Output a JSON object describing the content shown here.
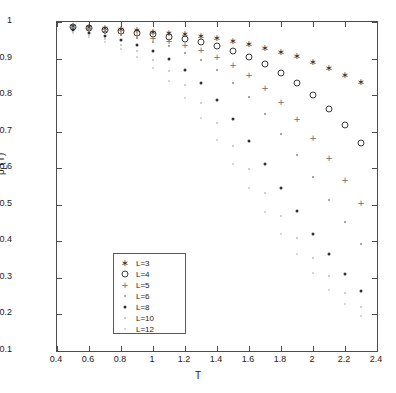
{
  "chart_data": {
    "type": "scatter",
    "title": "",
    "xlabel": "T",
    "ylabel": "ρ_L(T)",
    "xlim": [
      0.4,
      2.4
    ],
    "ylim": [
      0.1,
      1.0
    ],
    "xticks": [
      "0.4",
      "0.6",
      "0.8",
      "1",
      "1.2",
      "1.4",
      "1.6",
      "1.8",
      "2",
      "2.2",
      "2.4"
    ],
    "xtick_values": [
      0.4,
      0.6,
      0.8,
      1.0,
      1.2,
      1.4,
      1.6,
      1.8,
      2.0,
      2.2,
      2.4
    ],
    "yticks": [
      "0.1",
      "0.2",
      "0.3",
      "0.4",
      "0.5",
      "0.6",
      "0.7",
      "0.8",
      "0.9",
      "1"
    ],
    "ytick_values": [
      0.1,
      0.2,
      0.3,
      0.4,
      0.5,
      0.6,
      0.7,
      0.8,
      0.9,
      1.0
    ],
    "grid": false,
    "legend_position": "lower-left",
    "series": [
      {
        "name": "L=3",
        "marker": "asterisk",
        "color": "#2b2b2b",
        "x": [
          0.5,
          0.6,
          0.7,
          0.8,
          0.9,
          1.0,
          1.1,
          1.2,
          1.3,
          1.4,
          1.5,
          1.6,
          1.7,
          1.8,
          1.9,
          2.0,
          2.1,
          2.2,
          2.3
        ],
        "y": [
          0.988,
          0.986,
          0.983,
          0.98,
          0.977,
          0.974,
          0.97,
          0.966,
          0.961,
          0.955,
          0.948,
          0.94,
          0.93,
          0.919,
          0.906,
          0.891,
          0.874,
          0.856,
          0.835
        ]
      },
      {
        "name": "L=4",
        "marker": "circle",
        "color": "#3a3a3a",
        "x": [
          0.5,
          0.6,
          0.7,
          0.8,
          0.9,
          1.0,
          1.1,
          1.2,
          1.3,
          1.4,
          1.5,
          1.6,
          1.7,
          1.8,
          1.9,
          2.0,
          2.1,
          2.2,
          2.3
        ],
        "y": [
          0.986,
          0.983,
          0.979,
          0.975,
          0.971,
          0.966,
          0.96,
          0.953,
          0.945,
          0.934,
          0.921,
          0.905,
          0.885,
          0.861,
          0.833,
          0.8,
          0.762,
          0.718,
          0.668
        ]
      },
      {
        "name": "L=5",
        "marker": "plus",
        "color": "#6d6d6d",
        "x": [
          0.5,
          0.6,
          0.7,
          0.8,
          0.9,
          1.0,
          1.1,
          1.2,
          1.3,
          1.4,
          1.5,
          1.6,
          1.7,
          1.8,
          1.9,
          2.0,
          2.1,
          2.2,
          2.3
        ],
        "y": [
          0.984,
          0.98,
          0.975,
          0.97,
          0.964,
          0.957,
          0.948,
          0.937,
          0.923,
          0.905,
          0.882,
          0.854,
          0.82,
          0.78,
          0.735,
          0.684,
          0.628,
          0.568,
          0.505
        ]
      },
      {
        "name": "L=6",
        "marker": "dot",
        "color": "#8a8a8a",
        "x": [
          0.5,
          0.6,
          0.7,
          0.8,
          0.9,
          1.0,
          1.1,
          1.2,
          1.3,
          1.4,
          1.5,
          1.6,
          1.7,
          1.8,
          1.9,
          2.0,
          2.1,
          2.2,
          2.3
        ],
        "y": [
          0.982,
          0.977,
          0.971,
          0.964,
          0.956,
          0.946,
          0.933,
          0.916,
          0.895,
          0.868,
          0.834,
          0.794,
          0.747,
          0.694,
          0.637,
          0.576,
          0.514,
          0.452,
          0.392
        ]
      },
      {
        "name": "L=8",
        "marker": "dot-dark",
        "color": "#2f2f2f",
        "x": [
          0.5,
          0.6,
          0.7,
          0.8,
          0.9,
          1.0,
          1.1,
          1.2,
          1.3,
          1.4,
          1.5,
          1.6,
          1.7,
          1.8,
          1.9,
          2.0,
          2.1,
          2.2,
          2.3
        ],
        "y": [
          0.978,
          0.971,
          0.962,
          0.951,
          0.938,
          0.921,
          0.898,
          0.869,
          0.832,
          0.787,
          0.734,
          0.675,
          0.612,
          0.547,
          0.483,
          0.421,
          0.364,
          0.311,
          0.264
        ]
      },
      {
        "name": "L=10",
        "marker": "dot-faint",
        "color": "#bdbdbd",
        "x": [
          0.5,
          0.6,
          0.7,
          0.8,
          0.9,
          1.0,
          1.1,
          1.2,
          1.3,
          1.4,
          1.5,
          1.6,
          1.7,
          1.8,
          1.9,
          2.0,
          2.1,
          2.2,
          2.3
        ],
        "y": [
          0.974,
          0.965,
          0.953,
          0.938,
          0.92,
          0.897,
          0.866,
          0.827,
          0.779,
          0.723,
          0.662,
          0.597,
          0.532,
          0.469,
          0.409,
          0.354,
          0.304,
          0.26,
          0.221
        ]
      },
      {
        "name": "L=12",
        "marker": "dot-faint2",
        "color": "#c9c9c9",
        "x": [
          0.5,
          0.6,
          0.7,
          0.8,
          0.9,
          1.0,
          1.1,
          1.2,
          1.3,
          1.4,
          1.5,
          1.6,
          1.7,
          1.8,
          1.9,
          2.0,
          2.1,
          2.2,
          2.3
        ],
        "y": [
          0.97,
          0.959,
          0.945,
          0.927,
          0.904,
          0.875,
          0.838,
          0.792,
          0.738,
          0.677,
          0.612,
          0.546,
          0.481,
          0.42,
          0.364,
          0.313,
          0.268,
          0.229,
          0.195
        ]
      }
    ]
  },
  "legend": {
    "items": [
      {
        "label": "L=3"
      },
      {
        "label": "L=4"
      },
      {
        "label": "L=5"
      },
      {
        "label": "L=6"
      },
      {
        "label": "L=8"
      },
      {
        "label": "L=10"
      },
      {
        "label": "L=12"
      }
    ]
  },
  "axes": {
    "x_title": "T",
    "y_title_main": "ρ",
    "y_title_sub": "L",
    "y_title_tail": "(T)"
  }
}
